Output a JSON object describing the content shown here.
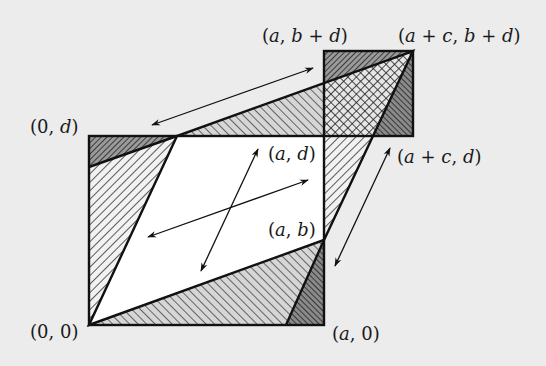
{
  "diagram": {
    "labels": {
      "origin": "(0, 0)",
      "a_0": "(a, 0)",
      "zero_d": "(0, d)",
      "a_b": "(a, b)",
      "a_d": "(a, d)",
      "a_b_plus_d": "(a, b + d)",
      "a_plus_c_b_plus_d": "(a + c, b + d)",
      "a_plus_c_d": "(a + c, d)"
    },
    "points_px": {
      "origin": [
        89,
        325
      ],
      "a_0": [
        324,
        325
      ],
      "zero_d": [
        89,
        136
      ],
      "c_d": [
        177,
        136
      ],
      "a_b": [
        324,
        240
      ],
      "a_d": [
        324,
        136
      ],
      "a_b_plus_d": [
        324,
        51
      ],
      "a_plus_c_b_plus_d": [
        413,
        51
      ],
      "a_plus_c_d": [
        413,
        136
      ]
    },
    "regions": [
      {
        "name": "parallelogram",
        "fill": "white"
      },
      {
        "name": "left-triangle",
        "fill": "hatch-backslash"
      },
      {
        "name": "top-left-dark-triangle",
        "fill": "hatch-dense-backslash"
      },
      {
        "name": "bottom-triangle",
        "fill": "hatch-forward"
      },
      {
        "name": "bottom-right-dark-triangle",
        "fill": "hatch-dense-forward"
      },
      {
        "name": "top-strip-triangle",
        "fill": "hatch-forward"
      },
      {
        "name": "right-strip-triangle",
        "fill": "hatch-backslash"
      },
      {
        "name": "square-top-dark-triangle",
        "fill": "hatch-dense-backslash"
      },
      {
        "name": "square-crosshatch",
        "fill": "crosshatch"
      },
      {
        "name": "square-right-dark-triangle",
        "fill": "hatch-dense-forward"
      }
    ],
    "arrows": [
      {
        "name": "top-arrow",
        "from": [
          152,
          125
        ],
        "to": [
          313,
          68
        ]
      },
      {
        "name": "center-arrow-shallow",
        "from": [
          148,
          237
        ],
        "to": [
          308,
          180
        ]
      },
      {
        "name": "center-arrow-steep",
        "from": [
          201,
          271
        ],
        "to": [
          258,
          149
        ]
      },
      {
        "name": "right-arrow",
        "from": [
          335,
          266
        ],
        "to": [
          390,
          148
        ]
      }
    ],
    "colors": {
      "background": "#ececec",
      "line": "#111111",
      "hatch_light": "#555555",
      "hatch_dark": "#222222"
    }
  }
}
